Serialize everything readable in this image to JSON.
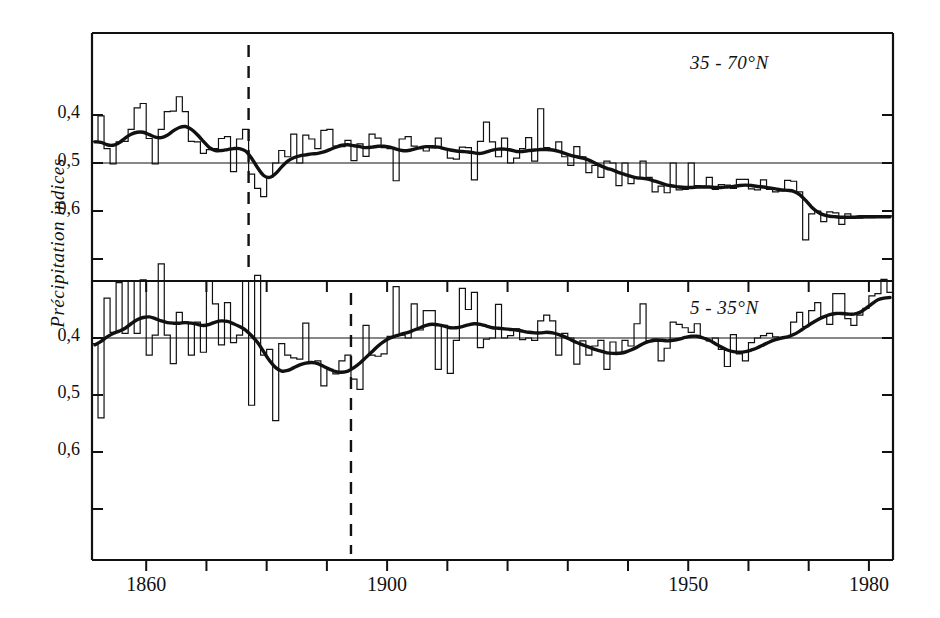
{
  "figure": {
    "ylabel": "Précipitation indices",
    "background": "#ffffff",
    "ink": "#111111"
  },
  "axes": {
    "x_ticks_major": [
      {
        "year": 1860,
        "label": "1860"
      },
      {
        "year": 1900,
        "label": "1900"
      },
      {
        "year": 1950,
        "label": "1950"
      },
      {
        "year": 1980,
        "label": "1980"
      }
    ],
    "x_ticks_minor_step": 10,
    "x_range": [
      1851,
      1983
    ],
    "y_tick_labels_top": [
      "0,6",
      "0,5",
      "0,4"
    ],
    "y_tick_labels_bottom": [
      "0,6",
      "0,5",
      "0,4"
    ]
  },
  "chart_data": [
    {
      "type": "line",
      "title": "35 - 70°N",
      "panel": "top",
      "xlabel": "",
      "ylabel": "Précipitation indices",
      "xlim": [
        1851,
        1983
      ],
      "ylim": [
        0.31,
        0.72
      ],
      "yticks": [
        0.4,
        0.5,
        0.6
      ],
      "ytick_labels": [
        "0,4",
        "0,5",
        "0,6"
      ],
      "grid": false,
      "legend": "none",
      "reference_line_y": 0.5,
      "annotations": [
        {
          "type": "vertical-dashed-line",
          "x": 1877
        }
      ],
      "series": [
        {
          "name": "annual precipitation index",
          "style": "step-histogram",
          "x_start": 1851,
          "values": [
            0.455,
            0.402,
            0.47,
            0.502,
            0.456,
            0.455,
            0.43,
            0.385,
            0.376,
            0.449,
            0.502,
            0.43,
            0.393,
            0.392,
            0.362,
            0.393,
            0.455,
            0.456,
            0.48,
            0.472,
            0.47,
            0.449,
            0.445,
            0.518,
            0.45,
            0.43,
            0.523,
            0.553,
            0.57,
            0.53,
            0.5,
            0.474,
            0.487,
            0.44,
            0.5,
            0.442,
            0.45,
            0.47,
            0.432,
            0.43,
            0.465,
            0.466,
            0.453,
            0.495,
            0.46,
            0.486,
            0.44,
            0.448,
            0.468,
            0.47,
            0.537,
            0.45,
            0.445,
            0.465,
            0.47,
            0.475,
            0.468,
            0.448,
            0.47,
            0.49,
            0.492,
            0.467,
            0.468,
            0.535,
            0.455,
            0.415,
            0.456,
            0.487,
            0.448,
            0.5,
            0.49,
            0.47,
            0.447,
            0.496,
            0.387,
            0.468,
            0.474,
            0.456,
            0.487,
            0.505,
            0.466,
            0.487,
            0.52,
            0.505,
            0.53,
            0.496,
            0.5,
            0.547,
            0.5,
            0.543,
            0.53,
            0.496,
            0.53,
            0.56,
            0.548,
            0.562,
            0.5,
            0.556,
            0.555,
            0.5,
            0.547,
            0.548,
            0.53,
            0.555,
            0.545,
            0.546,
            0.553,
            0.534,
            0.534,
            0.554,
            0.556,
            0.535,
            0.555,
            0.56,
            0.558,
            0.536,
            0.538,
            0.56,
            0.66,
            0.606,
            0.6,
            0.622,
            0.602,
            0.604,
            0.628,
            0.606,
            0.612,
            0.615,
            0.614,
            0.614,
            0.612,
            0.612,
            0.61
          ]
        },
        {
          "name": "smoothed (low-pass) curve",
          "style": "thick-smooth-line",
          "x_start": 1851,
          "values": [
            0.456,
            0.457,
            0.462,
            0.463,
            0.458,
            0.448,
            0.44,
            0.436,
            0.436,
            0.441,
            0.446,
            0.447,
            0.442,
            0.433,
            0.426,
            0.424,
            0.43,
            0.441,
            0.455,
            0.468,
            0.474,
            0.474,
            0.472,
            0.47,
            0.47,
            0.475,
            0.49,
            0.51,
            0.526,
            0.53,
            0.522,
            0.508,
            0.496,
            0.489,
            0.485,
            0.483,
            0.481,
            0.48,
            0.477,
            0.472,
            0.467,
            0.463,
            0.462,
            0.464,
            0.466,
            0.468,
            0.467,
            0.465,
            0.465,
            0.467,
            0.471,
            0.474,
            0.474,
            0.471,
            0.468,
            0.466,
            0.466,
            0.467,
            0.47,
            0.473,
            0.475,
            0.476,
            0.477,
            0.479,
            0.48,
            0.477,
            0.473,
            0.471,
            0.471,
            0.473,
            0.476,
            0.476,
            0.474,
            0.473,
            0.472,
            0.472,
            0.473,
            0.476,
            0.48,
            0.484,
            0.487,
            0.49,
            0.494,
            0.5,
            0.506,
            0.511,
            0.515,
            0.52,
            0.524,
            0.528,
            0.531,
            0.532,
            0.534,
            0.538,
            0.542,
            0.546,
            0.548,
            0.55,
            0.551,
            0.551,
            0.55,
            0.55,
            0.55,
            0.551,
            0.551,
            0.55,
            0.549,
            0.547,
            0.546,
            0.547,
            0.549,
            0.55,
            0.552,
            0.554,
            0.556,
            0.557,
            0.559,
            0.566,
            0.578,
            0.592,
            0.602,
            0.608,
            0.611,
            0.612,
            0.613,
            0.613,
            0.613,
            0.612,
            0.612,
            0.612,
            0.612,
            0.612,
            0.612
          ]
        }
      ]
    },
    {
      "type": "line",
      "title": "5 - 35°N",
      "panel": "bottom",
      "xlabel": "",
      "ylabel": "Précipitation indices",
      "xlim": [
        1851,
        1983
      ],
      "ylim": [
        0.24,
        0.66
      ],
      "yticks": [
        0.4,
        0.5,
        0.6
      ],
      "ytick_labels": [
        "0,4",
        "0,5",
        "0,6"
      ],
      "grid": false,
      "legend": "none",
      "reference_line_y": 0.4,
      "annotations": [
        {
          "type": "vertical-dashed-line",
          "x": 1894
        }
      ],
      "series": [
        {
          "name": "annual precipitation index",
          "style": "step-histogram",
          "x_start": 1851,
          "values": [
            0.41,
            0.54,
            0.33,
            0.39,
            0.303,
            0.392,
            0.3,
            0.392,
            0.298,
            0.43,
            0.395,
            0.27,
            0.395,
            0.445,
            0.355,
            0.372,
            0.43,
            0.372,
            0.425,
            0.3,
            0.34,
            0.412,
            0.338,
            0.408,
            0.395,
            0.3,
            0.518,
            0.29,
            0.43,
            0.42,
            0.545,
            0.41,
            0.43,
            0.435,
            0.437,
            0.374,
            0.443,
            0.44,
            0.484,
            0.455,
            0.463,
            0.44,
            0.43,
            0.472,
            0.49,
            0.378,
            0.43,
            0.432,
            0.428,
            0.397,
            0.31,
            0.395,
            0.4,
            0.34,
            0.386,
            0.352,
            0.352,
            0.455,
            0.378,
            0.462,
            0.404,
            0.313,
            0.35,
            0.32,
            0.417,
            0.402,
            0.4,
            0.341,
            0.4,
            0.396,
            0.384,
            0.403,
            0.4,
            0.404,
            0.37,
            0.36,
            0.37,
            0.43,
            0.392,
            0.4,
            0.446,
            0.405,
            0.43,
            0.414,
            0.404,
            0.455,
            0.407,
            0.425,
            0.404,
            0.414,
            0.375,
            0.34,
            0.405,
            0.402,
            0.44,
            0.418,
            0.372,
            0.376,
            0.382,
            0.39,
            0.375,
            0.4,
            0.405,
            0.4,
            0.42,
            0.45,
            0.394,
            0.428,
            0.44,
            0.408,
            0.4,
            0.396,
            0.392,
            0.398,
            0.4,
            0.398,
            0.372,
            0.355,
            0.38,
            0.352,
            0.338,
            0.364,
            0.376,
            0.322,
            0.322,
            0.366,
            0.378,
            0.36,
            0.348,
            0.326,
            0.322,
            0.297,
            0.32
          ]
        },
        {
          "name": "smoothed (low-pass) curve",
          "style": "thick-smooth-line",
          "x_start": 1851,
          "values": [
            0.412,
            0.406,
            0.398,
            0.392,
            0.388,
            0.383,
            0.375,
            0.368,
            0.364,
            0.363,
            0.366,
            0.37,
            0.373,
            0.374,
            0.374,
            0.373,
            0.374,
            0.376,
            0.378,
            0.376,
            0.372,
            0.37,
            0.371,
            0.375,
            0.38,
            0.386,
            0.396,
            0.408,
            0.424,
            0.44,
            0.452,
            0.458,
            0.457,
            0.452,
            0.447,
            0.444,
            0.443,
            0.445,
            0.45,
            0.455,
            0.459,
            0.46,
            0.458,
            0.452,
            0.444,
            0.434,
            0.424,
            0.414,
            0.406,
            0.4,
            0.396,
            0.393,
            0.39,
            0.386,
            0.382,
            0.378,
            0.376,
            0.377,
            0.379,
            0.382,
            0.382,
            0.38,
            0.377,
            0.375,
            0.376,
            0.379,
            0.382,
            0.383,
            0.384,
            0.385,
            0.386,
            0.388,
            0.39,
            0.391,
            0.391,
            0.39,
            0.391,
            0.394,
            0.398,
            0.403,
            0.408,
            0.412,
            0.416,
            0.42,
            0.423,
            0.426,
            0.427,
            0.427,
            0.425,
            0.421,
            0.416,
            0.41,
            0.406,
            0.404,
            0.404,
            0.405,
            0.404,
            0.402,
            0.399,
            0.397,
            0.397,
            0.4,
            0.404,
            0.41,
            0.416,
            0.421,
            0.424,
            0.425,
            0.424,
            0.421,
            0.417,
            0.412,
            0.407,
            0.403,
            0.4,
            0.398,
            0.394,
            0.388,
            0.381,
            0.374,
            0.368,
            0.363,
            0.359,
            0.357,
            0.357,
            0.358,
            0.358,
            0.355,
            0.348,
            0.34,
            0.333,
            0.33,
            0.329
          ]
        }
      ]
    }
  ]
}
